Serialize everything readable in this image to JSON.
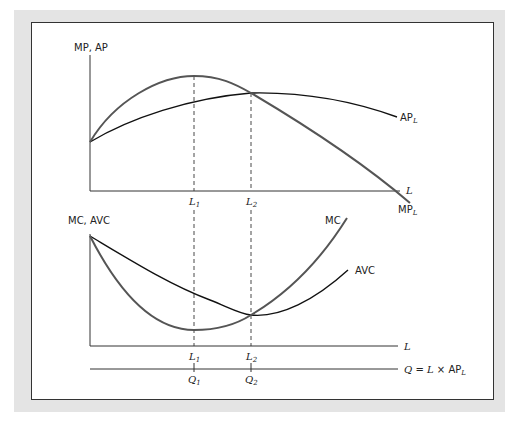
{
  "diagram": {
    "type": "economics-production-cost-curves",
    "top_panel": {
      "y_axis_label": "MP, AP",
      "x_axis_label": "L",
      "curves": [
        {
          "name": "MP",
          "label": "MP",
          "subscript": "L",
          "color": "#555555"
        },
        {
          "name": "AP",
          "label": "AP",
          "subscript": "L",
          "color": "#111111"
        }
      ],
      "markers": [
        {
          "label": "L",
          "subscript": "1",
          "note": "MP maximum"
        },
        {
          "label": "L",
          "subscript": "2",
          "note": "MP = AP (AP maximum)"
        }
      ]
    },
    "bottom_panel": {
      "y_axis_label": "MC, AVC",
      "x_axis_label": "L",
      "q_axis": {
        "label_q": "Q",
        "label_eq": "=",
        "label_l": "L",
        "label_times": "×",
        "label_ap": "AP",
        "label_ap_sub": "L"
      },
      "curves": [
        {
          "name": "MC",
          "label": "MC",
          "color": "#555555"
        },
        {
          "name": "AVC",
          "label": "AVC",
          "color": "#111111"
        }
      ],
      "markers": [
        {
          "label": "L",
          "subscript": "1",
          "q_label": "Q",
          "q_subscript": "1",
          "note": "MC minimum"
        },
        {
          "label": "L",
          "subscript": "2",
          "q_label": "Q",
          "q_subscript": "2",
          "note": "MC = AVC (AVC minimum)"
        }
      ]
    },
    "colors": {
      "frame_background": "#e4e4e4",
      "panel_background": "#ffffff",
      "axis": "#333333",
      "mp_mc_curve": "#555555",
      "ap_avc_curve": "#111111"
    }
  }
}
